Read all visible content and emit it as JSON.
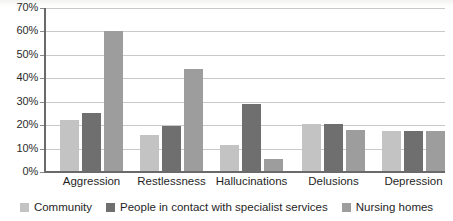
{
  "chart_data": {
    "type": "bar",
    "title": "",
    "subtitle": "",
    "xlabel": "",
    "ylabel": "",
    "ylim": [
      0,
      70
    ],
    "ytick_labels": [
      "0%",
      "10%",
      "20%",
      "30%",
      "40%",
      "50%",
      "60%",
      "70%"
    ],
    "ytick_values": [
      0,
      10,
      20,
      30,
      40,
      50,
      60,
      70
    ],
    "grid": true,
    "legend_position": "bottom",
    "categories": [
      "Aggression",
      "Restlessness",
      "Hallucinations",
      "Delusions",
      "Depression"
    ],
    "series": [
      {
        "name": "Community",
        "color": "#c3c3c3",
        "values": [
          22,
          16,
          11.5,
          20.5,
          17.5
        ]
      },
      {
        "name": "People in contact with specialist services",
        "color": "#6f6f6f",
        "values": [
          25,
          19.5,
          29,
          20.5,
          17.5
        ]
      },
      {
        "name": "Nursing homes",
        "color": "#9d9d9d",
        "values": [
          60,
          44,
          5.5,
          18,
          17.5
        ]
      }
    ]
  },
  "colors": {
    "series_community": "#c3c3c3",
    "series_specialist": "#6f6f6f",
    "series_nursing": "#9d9d9d",
    "axis": "#6a6a6a",
    "gridline": "#c9c9c9",
    "text": "#1f1f1f",
    "background": "#ffffff"
  }
}
